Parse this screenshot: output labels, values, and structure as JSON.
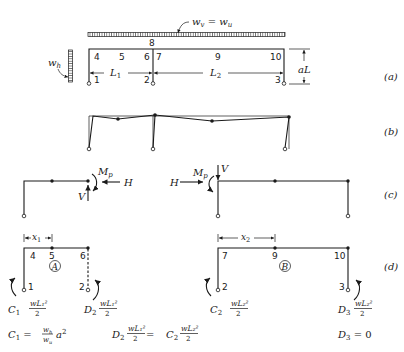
{
  "figure": {
    "panels": {
      "a": {
        "label": "(a)",
        "vertical_load": "w_v = w_u",
        "vertical_load_parts": {
          "w": "w",
          "v_sub": "v",
          "eq": " = ",
          "w2": "w",
          "u_sub": "u"
        },
        "horizontal_load": {
          "w": "w",
          "sub": "h"
        },
        "node_labels": [
          "1",
          "2",
          "3",
          "4",
          "5",
          "6",
          "7",
          "8",
          "9",
          "10"
        ],
        "span_labels": [
          {
            "main": "L",
            "sub": "1"
          },
          {
            "main": "L",
            "sub": "2"
          }
        ],
        "height_label": "aL"
      },
      "b": {
        "label": "(b)"
      },
      "c": {
        "label": "(c)",
        "left": {
          "moment": {
            "main": "M",
            "sub": "p"
          },
          "horizontal": "H",
          "vertical": "V"
        },
        "right": {
          "moment": {
            "main": "M",
            "sub": "p"
          },
          "horizontal": "H",
          "vertical": "V"
        }
      },
      "d": {
        "label": "(d)",
        "left": {
          "dimension": {
            "main": "x",
            "sub": "1"
          },
          "nodes": [
            "4",
            "5",
            "6",
            "1",
            "2"
          ],
          "region": "A",
          "reaction_left": {
            "coef": "C",
            "coef_sub": "1",
            "num": "wL₁²",
            "den": "2"
          },
          "reaction_right": {
            "coef": "D",
            "coef_sub": "2",
            "num": "wL₁²",
            "den": "2"
          }
        },
        "right": {
          "dimension": {
            "main": "x",
            "sub": "2"
          },
          "nodes": [
            "7",
            "9",
            "10",
            "2",
            "3"
          ],
          "region": "B",
          "reaction_left": {
            "coef": "C",
            "coef_sub": "2",
            "num": "wL₂²",
            "den": "2"
          },
          "reaction_right": {
            "coef": "D",
            "coef_sub": "3",
            "num": "wL₂²",
            "den": "2"
          }
        },
        "equations": {
          "c1": {
            "lhs": "C",
            "lhs_sub": "1",
            "eq": " = ",
            "num": "w",
            "num_sub": "h",
            "den": "w",
            "den_sub": "u",
            "tail": "a",
            "tail_sup": "2"
          },
          "d2_c2": {
            "coef1": "D",
            "coef1_sub": "2",
            "num1": "wL₁²",
            "den1": "2",
            "eq": " = ",
            "coef2": "C",
            "coef2_sub": "2",
            "num2": "wL₂²",
            "den2": "2"
          },
          "d3": {
            "lhs": "D",
            "lhs_sub": "3",
            "rhs": " = 0"
          }
        }
      }
    }
  }
}
